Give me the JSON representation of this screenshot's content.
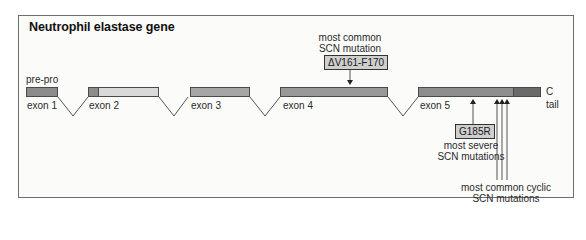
{
  "diagram": {
    "title": "Neutrophil elastase gene",
    "colors": {
      "exon_dark": "#8a8a8a",
      "exon_medium": "#a6a6a6",
      "exon_light": "#d9d9d9",
      "c_tail": "#6a6a6a",
      "mutation_box": "#cfcfcf",
      "frame_border": "#6e6e6e"
    },
    "exons": [
      {
        "label": "exon 1",
        "above_label": "pre-pro"
      },
      {
        "label": "exon 2"
      },
      {
        "label": "exon 3"
      },
      {
        "label": "exon 4"
      },
      {
        "label": "exon 5"
      }
    ],
    "c_tail": {
      "line1": "C",
      "line2": "tail"
    },
    "annotations": {
      "common": {
        "line1": "most common",
        "line2": "SCN mutation",
        "mutation": "ΔV161-F170"
      },
      "severe": {
        "mutation": "G185R",
        "line1": "most severe",
        "line2": "SCN mutations"
      },
      "cyclic": {
        "line1": "most common cyclic",
        "line2": "SCN mutations"
      }
    }
  }
}
